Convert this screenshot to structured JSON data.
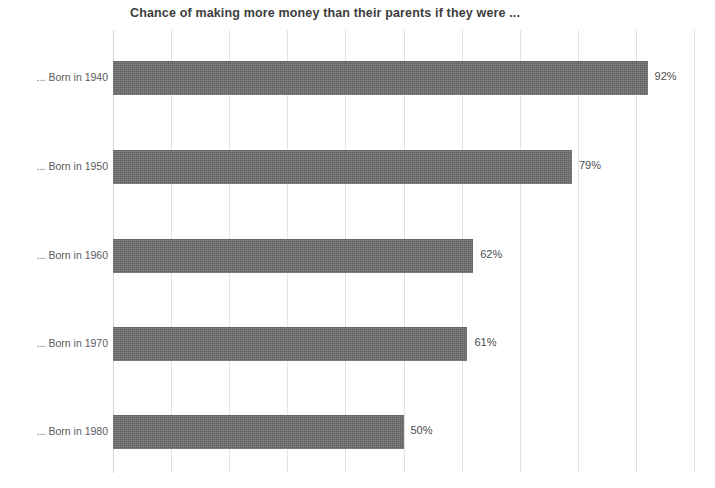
{
  "chart_data": {
    "type": "bar",
    "orientation": "horizontal",
    "title": "Chance of making more money than their parents if they were ...",
    "xlabel": "",
    "ylabel": "",
    "categories": [
      "... Born in 1940",
      "... Born in 1950",
      "... Born in 1960",
      "... Born in 1970",
      "... Born in 1980"
    ],
    "values": [
      92,
      79,
      62,
      61,
      50
    ],
    "value_labels": [
      "92%",
      "79%",
      "62%",
      "61%",
      "50%"
    ],
    "xlim": [
      0,
      100
    ],
    "xticks": [
      0,
      10,
      20,
      30,
      40,
      50,
      60,
      70,
      80,
      90,
      100
    ],
    "xtick_labels": [
      "",
      "",
      "",
      "",
      "",
      "",
      "",
      "",
      "",
      "",
      ""
    ],
    "grid": true,
    "grid_axis": "x",
    "legend": false,
    "bar_color": "#5f5f5f",
    "grid_color": "#e3e3e3",
    "background_color": "#ffffff",
    "text_color": "#4a4a4a"
  }
}
